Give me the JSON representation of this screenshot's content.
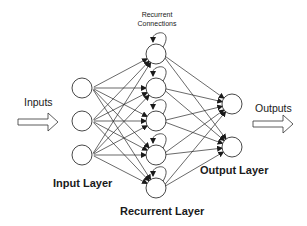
{
  "diagram": {
    "labels": {
      "recurrent_connections_line1": "Recurrent",
      "recurrent_connections_line2": "Connections",
      "inputs": "Inputs",
      "outputs": "Outputs",
      "input_layer": "Input Layer",
      "recurrent_layer": "Recurrent Layer",
      "output_layer": "Output Layer"
    },
    "layers": {
      "input": {
        "count": 3,
        "x": 82,
        "ys": [
          88,
          121,
          155
        ]
      },
      "recurrent": {
        "count": 5,
        "x": 156,
        "ys": [
          54,
          88,
          121,
          155,
          188
        ]
      },
      "output": {
        "count": 2,
        "x": 232,
        "ys": [
          104,
          147
        ]
      }
    },
    "node_radius": 10,
    "connections": "fully connected between adjacent layers; each recurrent node has a self-loop",
    "colors": {
      "stroke": "#2a2a2a",
      "background": "#ffffff"
    }
  }
}
